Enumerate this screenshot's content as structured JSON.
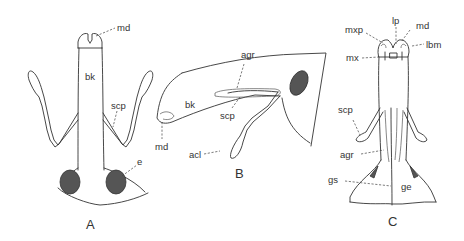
{
  "figure": {
    "panels": [
      {
        "id": "A",
        "label": "A",
        "view": "dorsal",
        "labels": {
          "md": "md",
          "bk": "bk",
          "scp": "scp",
          "e": "e"
        }
      },
      {
        "id": "B",
        "label": "B",
        "view": "lateral",
        "labels": {
          "agr": "agr",
          "bk": "bk",
          "scp": "scp",
          "md": "md",
          "acl": "acl"
        }
      },
      {
        "id": "C",
        "label": "C",
        "view": "ventral",
        "labels": {
          "lp": "lp",
          "mxp": "mxp",
          "md": "md",
          "lbm": "lbm",
          "mx": "mx",
          "scp": "scp",
          "agr": "agr",
          "gs": "gs",
          "ge": "ge"
        }
      }
    ],
    "colors": {
      "line": "#333333",
      "eye_fill": "#555555",
      "background": "#ffffff"
    }
  }
}
